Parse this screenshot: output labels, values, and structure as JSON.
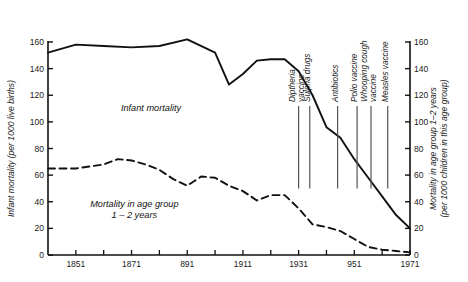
{
  "chart_data": {
    "type": "line",
    "title": "",
    "xlabel": "",
    "ylabel": "Infant mortality (per 1000 live births)",
    "y2label_line1": "Mortality in age group 1–2 years",
    "y2label_line2": "(per 1000 children in this age group)",
    "xlim": [
      1841,
      1971
    ],
    "ylim": [
      0,
      160
    ],
    "y2lim": [
      0,
      160
    ],
    "grid": false,
    "legend": "inline-labels",
    "xticks": [
      1851,
      1871,
      1891,
      1911,
      1931,
      1951,
      1971
    ],
    "xtick_labels": [
      "1851",
      "1871",
      "891",
      "1911",
      "1931",
      "951",
      "1971"
    ],
    "xminor_step": 10,
    "yticks": [
      0,
      20,
      40,
      60,
      80,
      100,
      120,
      140,
      160
    ],
    "ytick_labels": [
      "0",
      "20",
      "40",
      "60",
      "80",
      "100",
      "120",
      "140",
      "160"
    ],
    "y2ticks": [
      0,
      20,
      40,
      60,
      80,
      100,
      120,
      140,
      160
    ],
    "y2tick_labels": [
      "0",
      "20",
      "40",
      "60",
      "80",
      "100",
      "120",
      "140",
      "160"
    ],
    "series": [
      {
        "name": "Infant mortality",
        "style": "solid",
        "label_x": 1878,
        "label_y": 108,
        "x": [
          1841,
          1851,
          1861,
          1871,
          1881,
          1891,
          1901,
          1906,
          1911,
          1916,
          1921,
          1926,
          1931,
          1936,
          1941,
          1946,
          1951,
          1956,
          1961,
          1966,
          1971
        ],
        "values": [
          152,
          158,
          157,
          156,
          157,
          162,
          152,
          128,
          136,
          146,
          147,
          147,
          138,
          120,
          96,
          88,
          72,
          58,
          44,
          30,
          20
        ]
      },
      {
        "name": "Mortality in age group 1–2 years",
        "style": "dashed",
        "label_line1": "Mortality in age group",
        "label_line2": "1 – 2 years",
        "label_x": 1872,
        "label_y": 36,
        "x": [
          1841,
          1851,
          1861,
          1866,
          1871,
          1876,
          1881,
          1886,
          1891,
          1896,
          1901,
          1906,
          1911,
          1916,
          1921,
          1926,
          1931,
          1936,
          1941,
          1946,
          1951,
          1956,
          1961,
          1966,
          1971
        ],
        "values": [
          65,
          65,
          68,
          72,
          71,
          68,
          64,
          57,
          52,
          59,
          58,
          52,
          48,
          41,
          45,
          45,
          35,
          23,
          21,
          18,
          12,
          6,
          4,
          3,
          2
        ]
      }
    ],
    "annotations": [
      {
        "label": "Diptheria vaccine",
        "line1": "Diptheria",
        "line2": "vaccine",
        "x": 1931,
        "line_top_y": 112,
        "line_bottom_y": 50
      },
      {
        "label": "Sulpha drugs",
        "line1": "Sulpha drugs",
        "line2": "",
        "x": 1935,
        "line_top_y": 112,
        "line_bottom_y": 50
      },
      {
        "label": "Antibiotics",
        "line1": "Antibiotics",
        "line2": "",
        "x": 1945,
        "line_top_y": 112,
        "line_bottom_y": 50
      },
      {
        "label": "Polio vaccine",
        "line1": "Polio vaccine",
        "line2": "",
        "x": 1952,
        "line_top_y": 112,
        "line_bottom_y": 50
      },
      {
        "label": "Whooping cough vaccine",
        "line1": "Whooping cough",
        "line2": "vaccine",
        "x": 1957,
        "line_top_y": 112,
        "line_bottom_y": 50
      },
      {
        "label": "Measles vaccine",
        "line1": "Measles vaccine",
        "line2": "",
        "x": 1963,
        "line_top_y": 112,
        "line_bottom_y": 50
      }
    ],
    "colors": {
      "line": "#111111",
      "text": "#1a1a1a",
      "annotation_line": "#555555",
      "background": "#ffffff"
    }
  }
}
